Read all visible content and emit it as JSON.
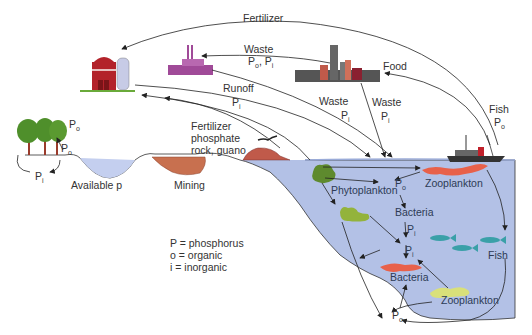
{
  "diagram": {
    "colors": {
      "water": "#b8c6e8",
      "water_deep": "#9fb2e0",
      "barn": "#b3222a",
      "silo": "#c7cbe6",
      "factory": "#a04a98",
      "phytoplankton": "#5e8a2e",
      "phytoplankton_light": "#93b33c",
      "zooplankton": "#e8614a",
      "zooplankton_light": "#d9e07a",
      "bacteria": "#e8614a",
      "fish": "#3aa0a8",
      "mining": "#c8704f",
      "trees": "#4f8f2b"
    },
    "flows": [
      {
        "label": "Fertilizer",
        "from": "fishing-boat",
        "to": "farm"
      },
      {
        "label": "Waste",
        "sublabel": "Po, Pi",
        "from": "city",
        "to": "factory"
      },
      {
        "label": "Food",
        "from": "fishing-boat",
        "to": "city"
      },
      {
        "label": "Runoff",
        "sublabel": "Pi",
        "from": "farm",
        "to": "ocean"
      },
      {
        "label": "Waste",
        "sublabel": "Pi",
        "from": "factory",
        "to": "ocean"
      },
      {
        "label": "Waste",
        "sublabel": "Pi",
        "from": "city",
        "to": "ocean"
      },
      {
        "label": "Fish",
        "sublabel": "Po",
        "from": "ocean",
        "to": "fishing-boat"
      },
      {
        "label": "Fertilizer phosphate rock, guano",
        "from": "guano-island",
        "to": "farm"
      }
    ],
    "labels": {
      "fertilizer_top": "Fertilizer",
      "waste_factory": "Waste",
      "waste_factory_p": "P",
      "waste_factory_o": "o",
      "waste_factory_comma": ", P",
      "waste_factory_i": "i",
      "food": "Food",
      "runoff": "Runoff",
      "runoff_p": "P",
      "runoff_i": "i",
      "waste_mid": "Waste",
      "waste_mid_p": "P",
      "waste_mid_i": "i",
      "waste_city": "Waste",
      "waste_city_p": "P",
      "waste_city_i": "i",
      "fish_top": "Fish",
      "fish_top_p": "P",
      "fish_top_o": "o",
      "fert_rock_1": "Fertilizer",
      "fert_rock_2": "phosphate",
      "fert_rock_3": "rock, guano",
      "trees_po_top": "P",
      "trees_po_top_o": "o",
      "trees_po_bottom": "P",
      "trees_po_bottom_o": "o",
      "trees_pi": "P",
      "trees_pi_i": "i",
      "available_p": "Available p",
      "mining": "Mining",
      "phytoplankton": "Phytoplankton",
      "po_upper": "P",
      "po_upper_o": "o",
      "zooplankton_upper": "Zooplankton",
      "bacteria_upper": "Bacteria",
      "pi_upper": "P",
      "pi_upper_i": "i",
      "pi_lower": "P",
      "pi_lower_i": "i",
      "fish_ocean": "Fish",
      "bacteria_lower": "Bacteria",
      "zooplankton_lower": "Zooplankton",
      "po_bottom": "P",
      "po_bottom_o": "o"
    },
    "legend": [
      "P = phosphorus",
      "o = organic",
      "i = inorganic"
    ]
  }
}
